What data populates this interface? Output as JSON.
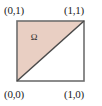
{
  "figure": {
    "background_color": "#ffffff"
  },
  "chart_data": {
    "type": "diagram",
    "title": "",
    "xlabel": "",
    "ylabel": "",
    "xlim": [
      0,
      1
    ],
    "ylim": [
      0,
      1
    ],
    "grid": false,
    "legend": null,
    "shapes": [
      {
        "name": "unit-square",
        "kind": "rectangle",
        "points": [
          [
            0,
            0
          ],
          [
            1,
            0
          ],
          [
            1,
            1
          ],
          [
            0,
            1
          ]
        ],
        "fill": "none",
        "stroke": "#6e6e6e",
        "stroke_width": 1.6
      },
      {
        "name": "region-omega",
        "kind": "polygon",
        "points": [
          [
            0,
            0
          ],
          [
            1,
            1
          ],
          [
            0,
            1
          ]
        ],
        "fill": "#e9cfc3",
        "stroke": "#4a4a4a",
        "stroke_width": 1.4
      },
      {
        "name": "diagonal",
        "kind": "line",
        "points": [
          [
            0,
            0
          ],
          [
            1,
            1
          ]
        ],
        "stroke": "#4a4a4a",
        "stroke_width": 1.4
      }
    ],
    "annotations": [
      {
        "name": "region-label",
        "text": "Ω",
        "x": 0.28,
        "y": 0.72
      },
      {
        "name": "corner-top-left",
        "text": "(0,1)",
        "x": 0,
        "y": 1
      },
      {
        "name": "corner-top-right",
        "text": "(1,1)",
        "x": 1,
        "y": 1
      },
      {
        "name": "corner-bottom-left",
        "text": "(0,0)",
        "x": 0,
        "y": 0
      },
      {
        "name": "corner-bottom-right",
        "text": "(1,0)",
        "x": 1,
        "y": 0
      }
    ]
  },
  "labels": {
    "top_left": "(0,1)",
    "top_right": "(1,1)",
    "bottom_left": "(0,0)",
    "bottom_right": "(1,0)",
    "region": "Ω"
  },
  "colors": {
    "region_fill": "#e9cfc3",
    "square_stroke": "#6e6e6e",
    "diagonal_stroke": "#4a4a4a",
    "text": "#1b1b1b",
    "background": "#ffffff"
  }
}
